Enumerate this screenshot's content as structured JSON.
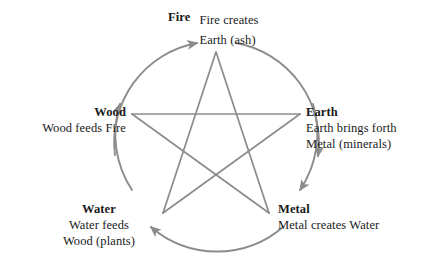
{
  "diagram": {
    "colors": {
      "line": "#8c8c8c",
      "arrow": "#8c8c8c",
      "text": "#1a1a1a",
      "background": "#ffffff"
    },
    "elements": [
      {
        "id": "fire",
        "name": "Fire",
        "desc_lines": [
          "Fire creates",
          "Earth (ash)"
        ]
      },
      {
        "id": "wood",
        "name": "Wood",
        "desc_lines": [
          "Wood feeds Fire"
        ]
      },
      {
        "id": "earth",
        "name": "Earth",
        "desc_lines": [
          "Earth brings forth",
          "Metal (minerals)"
        ]
      },
      {
        "id": "water",
        "name": "Water",
        "desc_lines": [
          "Water feeds",
          "Wood (plants)"
        ]
      },
      {
        "id": "metal",
        "name": "Metal",
        "desc_lines": [
          "Metal creates Water"
        ]
      }
    ],
    "cycle_arrows": [
      {
        "from": "wood",
        "to": "fire",
        "name": "arc-wood-to-fire"
      },
      {
        "from": "fire",
        "to": "earth",
        "name": "arc-fire-to-earth"
      },
      {
        "from": "earth",
        "to": "metal",
        "name": "arc-earth-to-metal"
      },
      {
        "from": "metal",
        "to": "water",
        "name": "arc-metal-to-water"
      },
      {
        "from": "water",
        "to": "wood",
        "name": "arc-water-to-wood"
      }
    ],
    "star_edges": [
      {
        "from": "fire",
        "to": "metal"
      },
      {
        "from": "metal",
        "to": "wood"
      },
      {
        "from": "wood",
        "to": "earth"
      },
      {
        "from": "earth",
        "to": "water"
      },
      {
        "from": "water",
        "to": "fire"
      }
    ]
  }
}
